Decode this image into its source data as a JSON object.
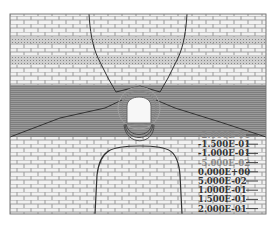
{
  "chart_data": {
    "type": "heatmap",
    "subtype": "contour",
    "title": "",
    "xlabel": "",
    "ylabel": "",
    "grid": false,
    "legend_position": "bottom-right",
    "strata": [
      {
        "name": "upper-limestone",
        "pattern": "brick"
      },
      {
        "name": "thin-silt-1",
        "pattern": "dotted"
      },
      {
        "name": "limestone-2",
        "pattern": "brick"
      },
      {
        "name": "silt-2",
        "pattern": "dotted"
      },
      {
        "name": "limestone-3",
        "pattern": "brick"
      },
      {
        "name": "sandstone",
        "pattern": "dense-lines"
      },
      {
        "name": "lower-limestone",
        "pattern": "brick"
      }
    ],
    "contour_levels": [
      {
        "label": "-2.000E-01",
        "value": -0.2
      },
      {
        "label": "-1.500E-01",
        "value": -0.15
      },
      {
        "label": "-1.000E-01",
        "value": -0.1
      },
      {
        "label": "-5.000E-02",
        "value": -0.05
      },
      {
        "label": "0.000E+00",
        "value": 0.0
      },
      {
        "label": "5.000E-02",
        "value": 0.05
      },
      {
        "label": "1.000E-01",
        "value": 0.1
      },
      {
        "label": "1.500E-01",
        "value": 0.15
      },
      {
        "label": "2.000E-01",
        "value": 0.2
      }
    ],
    "features": [
      "tunnel-opening",
      "upper-contour-funnel",
      "lower-contour-arch",
      "diagonal-contours"
    ]
  },
  "colors": {
    "frame": "#777777",
    "brick_line": "#9a9a9a",
    "band": "#8c8c8c",
    "contour": "#333333"
  }
}
